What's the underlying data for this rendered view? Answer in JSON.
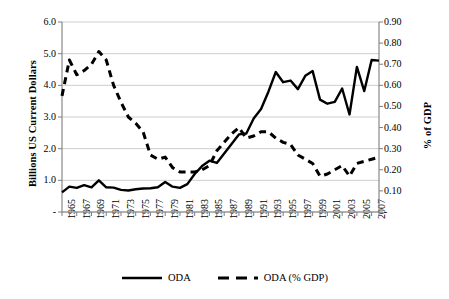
{
  "chart_data": {
    "type": "line",
    "title": "",
    "subtitle": "",
    "xlabel": "",
    "ylabel": "Billions US Current Dollars",
    "y2label": "% of GDP",
    "grid": true,
    "legend_position": "bottom",
    "x": [
      1965,
      1966,
      1967,
      1968,
      1969,
      1970,
      1971,
      1972,
      1973,
      1974,
      1975,
      1976,
      1977,
      1978,
      1979,
      1980,
      1981,
      1982,
      1983,
      1984,
      1985,
      1986,
      1987,
      1988,
      1989,
      1990,
      1991,
      1992,
      1993,
      1994,
      1995,
      1996,
      1997,
      1998,
      1999,
      2000,
      2001,
      2002,
      2003,
      2004,
      2005,
      2006,
      2007,
      2008
    ],
    "xtick_labels": [
      "1965",
      "1967",
      "1969",
      "1971",
      "1973",
      "1975",
      "1977",
      "1979",
      "1981",
      "1983",
      "1985",
      "1987",
      "1989",
      "1991",
      "1993",
      "1995",
      "1997",
      "1999",
      "2001",
      "2003",
      "2005",
      "2007"
    ],
    "xlim": [
      1965,
      2008
    ],
    "ylim": [
      0,
      6.0
    ],
    "ytick_labels": [
      "6.0",
      "5.0",
      "4.0",
      "3.0",
      "2.0",
      "1.0",
      "-"
    ],
    "ytick_values": [
      6.0,
      5.0,
      4.0,
      3.0,
      2.0,
      1.0,
      0
    ],
    "y2lim": [
      0,
      0.9
    ],
    "y2tick_labels": [
      "0.90",
      "0.80",
      "0.70",
      "0.60",
      "0.50",
      "0.40",
      "0.30",
      "0.20",
      "0.10",
      "-"
    ],
    "y2tick_values": [
      0.9,
      0.8,
      0.7,
      0.6,
      0.5,
      0.4,
      0.3,
      0.2,
      0.1,
      0
    ],
    "series": [
      {
        "name": "ODA",
        "axis": "left",
        "style": "solid",
        "color": "#000000",
        "values": [
          0.62,
          0.8,
          0.76,
          0.85,
          0.78,
          1.0,
          0.78,
          0.77,
          0.7,
          0.68,
          0.72,
          0.74,
          0.75,
          0.78,
          0.95,
          0.8,
          0.76,
          0.88,
          1.2,
          1.45,
          1.62,
          1.55,
          1.85,
          2.15,
          2.45,
          2.48,
          2.95,
          3.25,
          3.8,
          4.42,
          4.1,
          4.15,
          3.88,
          4.3,
          4.45,
          3.55,
          3.42,
          3.48,
          3.9,
          3.08,
          4.58,
          3.82,
          4.8,
          4.78
        ]
      },
      {
        "name": "ODA (% GDP)",
        "axis": "right",
        "style": "dashed",
        "color": "#000000",
        "values": [
          0.55,
          0.72,
          0.65,
          0.67,
          0.7,
          0.76,
          0.72,
          0.6,
          0.52,
          0.45,
          0.42,
          0.38,
          0.27,
          0.25,
          0.26,
          0.21,
          0.19,
          0.19,
          0.19,
          0.2,
          0.22,
          0.29,
          0.33,
          0.37,
          0.4,
          0.35,
          0.36,
          0.38,
          0.38,
          0.35,
          0.33,
          0.32,
          0.27,
          0.25,
          0.23,
          0.17,
          0.18,
          0.2,
          0.22,
          0.17,
          0.23,
          0.24,
          0.25,
          0.26
        ]
      }
    ],
    "annotations": []
  },
  "legend": {
    "items": [
      {
        "label": "ODA",
        "style": "solid"
      },
      {
        "label": "ODA (% GDP)",
        "style": "dashed"
      }
    ]
  }
}
